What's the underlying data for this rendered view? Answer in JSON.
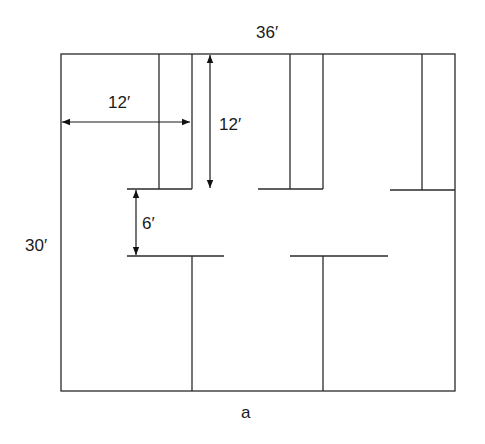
{
  "figure": {
    "caption": "a",
    "type": "floor-plan"
  },
  "dimensions": {
    "overall_width": "36′",
    "overall_height": "30′",
    "room_width": "12′",
    "room_depth": "12′",
    "corridor_width": "6′"
  },
  "colors": {
    "line": "#2a2a2a",
    "background": "#ffffff"
  }
}
